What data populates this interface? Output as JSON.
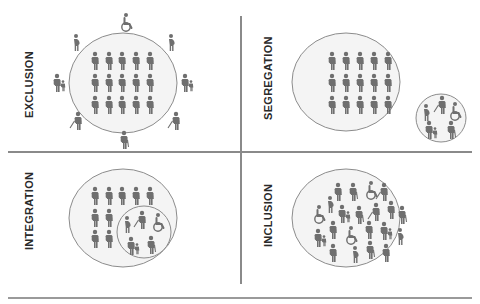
{
  "diagram": {
    "colors": {
      "figure": "#6f6f6f",
      "circle_stroke": "#8c8c8c",
      "circle_fill": "#f4f4f4",
      "divider": "#8a8a8a",
      "label": "#2a2a2a"
    },
    "quadrants": [
      {
        "id": "exclusion",
        "label": "EXCLUSION",
        "description": "Group of 15 standard figures inside circle; 8 diverse figures (wheelchair user, pregnant women, parent with child, blind persons with canes, elderly person) placed outside the circle"
      },
      {
        "id": "segregation",
        "label": "SEGREGATION",
        "description": "Large circle with 15 standard figures; separate small circle with diverse figures (pregnant woman, blind person, wheelchair user, parent with child, elderly person)"
      },
      {
        "id": "integration",
        "label": "INTEGRATION",
        "description": "Large circle with 9 standard figures; smaller inner circle containing diverse figures within the large circle"
      },
      {
        "id": "inclusion",
        "label": "INCLUSION",
        "description": "Single circle with all types of figures mixed together"
      }
    ]
  }
}
